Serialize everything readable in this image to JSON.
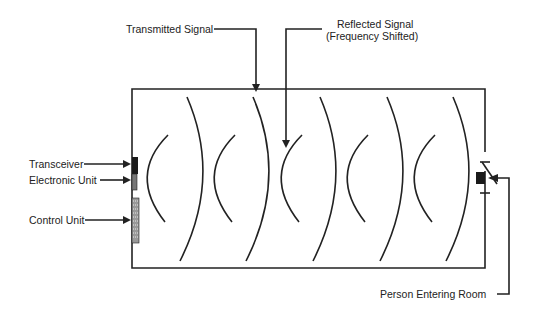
{
  "diagram": {
    "type": "microwave-motion-detector",
    "labels": {
      "transmitted": "Transmitted Signal",
      "reflected_line1": "Reflected Signal",
      "reflected_line2": "(Frequency Shifted)",
      "transceiver": "Transceiver",
      "electronic_unit": "Electronic Unit",
      "control_unit": "Control Unit",
      "person": "Person Entering Room"
    },
    "colors": {
      "line": "#222222",
      "fill": "#1a1a1a",
      "background": "#ffffff"
    }
  }
}
